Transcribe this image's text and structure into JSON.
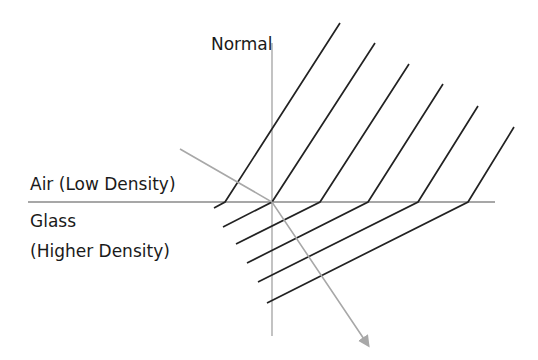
{
  "labels": {
    "normal": "Normal",
    "air": "Air (Low Density)",
    "glass": "Glass",
    "glass_density": "(Higher Density)"
  },
  "colors": {
    "wavefront": "#222222",
    "interface": "#8a8a8a",
    "normal_line": "#9a9a9a",
    "ray": "#a8a8a8",
    "text": "#1a1a1a"
  },
  "geometry": {
    "interface": {
      "x1": 28,
      "y": 202,
      "x2": 495
    },
    "normal": {
      "x": 272,
      "y1": 43,
      "y2": 336
    },
    "ray": {
      "start": [
        180,
        149
      ],
      "hit": [
        272,
        202
      ],
      "end": [
        368,
        345
      ]
    },
    "wavefronts": [
      {
        "top": [
          340,
          23
        ],
        "bend": [
          225,
          202
        ],
        "glass_end": [
          214,
          208
        ]
      },
      {
        "top": [
          375,
          43
        ],
        "bend": [
          272,
          202
        ],
        "glass_end": [
          223,
          227
        ]
      },
      {
        "top": [
          409,
          64
        ],
        "bend": [
          320,
          202
        ],
        "glass_end": [
          236,
          244
        ]
      },
      {
        "top": [
          443,
          84
        ],
        "bend": [
          368,
          202
        ],
        "glass_end": [
          247,
          263
        ]
      },
      {
        "top": [
          478,
          106
        ],
        "bend": [
          418,
          202
        ],
        "glass_end": [
          258,
          282
        ]
      },
      {
        "top": [
          514,
          127
        ],
        "bend": [
          468,
          202
        ],
        "glass_end": [
          267,
          303
        ]
      }
    ]
  }
}
